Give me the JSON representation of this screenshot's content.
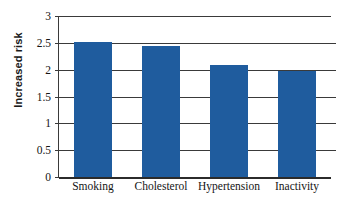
{
  "chart_data": {
    "type": "bar",
    "title": "",
    "xlabel": "",
    "ylabel": "Increased risk",
    "categories": [
      "Smoking",
      "Cholesterol",
      "Hypertension",
      "Inactivity"
    ],
    "values": [
      2.52,
      2.44,
      2.09,
      1.97
    ],
    "ylim": [
      0,
      3
    ],
    "ytick_values": [
      0,
      0.5,
      1,
      1.5,
      2,
      2.5,
      3
    ],
    "ytick_labels": [
      "0",
      "0.5",
      "1",
      "1.5",
      "2",
      "2.5",
      "3"
    ],
    "grid": true,
    "legend": null,
    "bar_color": "#1f5c9e",
    "axis_color": "#3a3a3a",
    "background": "#ffffff"
  }
}
